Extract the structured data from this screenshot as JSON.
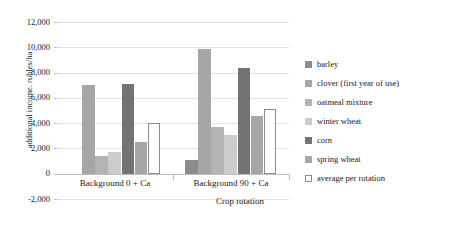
{
  "chart_data": {
    "type": "bar",
    "title": "",
    "xlabel": "Crop rotation",
    "ylabel": "additional income. rubles/ha",
    "categories": [
      "Background 0 + Ca",
      "Background 90 + Ca"
    ],
    "ylim": [
      -2000,
      12000
    ],
    "ytick_step": 2000,
    "ytick_labels": [
      "12,000",
      "10,000",
      "8,000",
      "6,000",
      "4,000",
      "2,000",
      "0",
      "-2,000"
    ],
    "ytick_values": [
      12000,
      10000,
      8000,
      6000,
      4000,
      2000,
      0,
      -2000
    ],
    "grid": true,
    "legend_position": "right",
    "series": [
      {
        "name": "barley",
        "color": "#8c8c8c",
        "values": [
          0,
          1100
        ]
      },
      {
        "name": "clover (first year of use)",
        "color": "#a6a6a6",
        "values": [
          7050,
          9900
        ]
      },
      {
        "name": "oatmeal mixture",
        "color": "#b3b3b3",
        "values": [
          1400,
          3700
        ]
      },
      {
        "name": "winter wheat",
        "color": "#cccccc",
        "values": [
          1750,
          3050
        ]
      },
      {
        "name": "corn",
        "color": "#737373",
        "values": [
          7100,
          8400
        ]
      },
      {
        "name": "spring wheat",
        "color": "#a6a6a6",
        "values": [
          2500,
          4600
        ]
      },
      {
        "name": "average per rotation",
        "color": "#ffffff",
        "border": "#8c8c8c",
        "values": [
          4050,
          5100
        ]
      }
    ]
  },
  "axis": {
    "y_title": "additional income. rubles/ha",
    "x_title": "Crop rotation"
  },
  "legend": {
    "items": [
      {
        "label": "barley"
      },
      {
        "label": "clover (first year of use)"
      },
      {
        "label": "oatmeal mixture"
      },
      {
        "label": "winter wheat"
      },
      {
        "label": "corn"
      },
      {
        "label": "spring wheat"
      },
      {
        "label": "average per rotation"
      }
    ]
  },
  "colors": {
    "grid": "#e3e3e3",
    "axis": "#bdbdbd",
    "text": "#1a1a1a"
  }
}
